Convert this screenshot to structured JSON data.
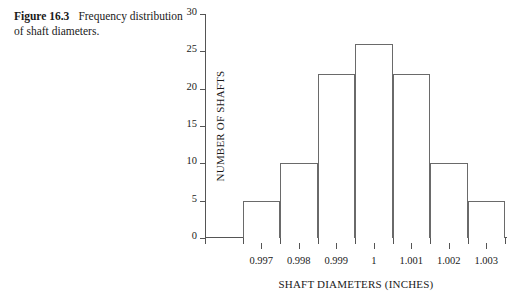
{
  "caption": {
    "figure_label": "Figure 16.3",
    "text": "Frequency distribution of shaft diameters."
  },
  "chart_data": {
    "type": "bar",
    "title": "",
    "subtitle": "",
    "xlabel": "SHAFT DIAMETERS (INCHES)",
    "ylabel": "NUMBER OF SHAFTS",
    "categories": [
      "0.997",
      "0.998",
      "0.999",
      "1",
      "1.001",
      "1.002",
      "1.003"
    ],
    "values": [
      5,
      10,
      22,
      26,
      22,
      10,
      5
    ],
    "xtick_labels": [
      "0.997",
      "0.998",
      "0.999",
      "1",
      "1.001",
      "1.002",
      "1.003"
    ],
    "ytick_labels": [
      "0",
      "5",
      "10",
      "15",
      "20",
      "25",
      "30"
    ],
    "ytick_values": [
      0,
      5,
      10,
      15,
      20,
      25,
      30
    ],
    "ylim": [
      0,
      30
    ],
    "grid": false,
    "legend": false,
    "legend_position": "none",
    "bar_fill": "#ffffff",
    "bar_edge_color": "#6a6a6a",
    "axis_color": "#555555",
    "text_color": "#1a1a1a",
    "background": "#ffffff",
    "bar_count": 7,
    "leading_empty_bins": 1
  }
}
